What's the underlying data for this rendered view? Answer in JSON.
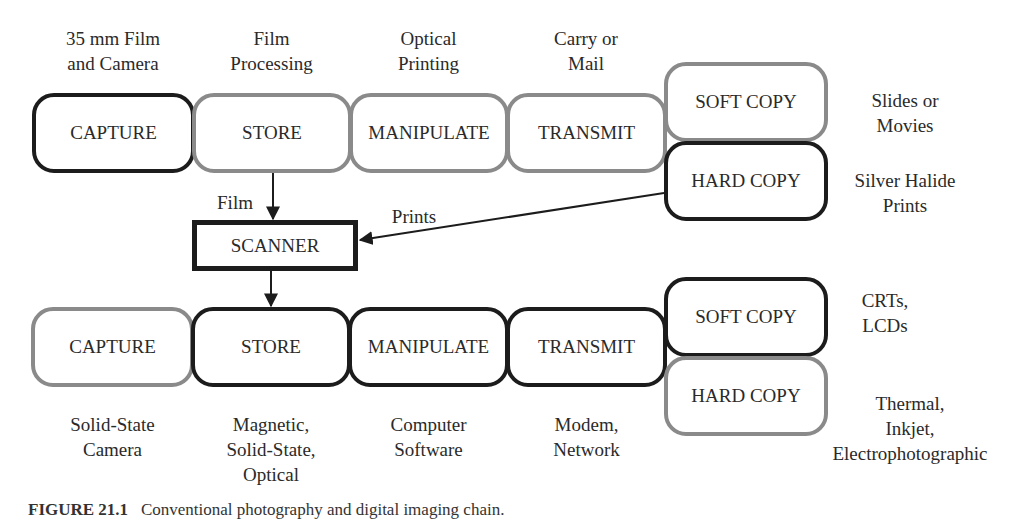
{
  "top_chain": {
    "captions": [
      "35 mm Film\nand Camera",
      "Film\nProcessing",
      "Optical\nPrinting",
      "Carry or\nMail"
    ],
    "boxes": [
      "CAPTURE",
      "STORE",
      "MANIPULATE",
      "TRANSMIT"
    ],
    "outputs": {
      "soft_copy": "SOFT COPY",
      "hard_copy": "HARD COPY",
      "soft_copy_note": "Slides or\nMovies",
      "hard_copy_note": "Silver Halide\nPrints"
    }
  },
  "scanner": {
    "label": "SCANNER",
    "film_label": "Film",
    "prints_label": "Prints"
  },
  "bottom_chain": {
    "boxes": [
      "CAPTURE",
      "STORE",
      "MANIPULATE",
      "TRANSMIT"
    ],
    "captions": [
      "Solid-State\nCamera",
      "Magnetic,\nSolid-State,\nOptical",
      "Computer\nSoftware",
      "Modem,\nNetwork"
    ],
    "outputs": {
      "soft_copy": "SOFT COPY",
      "hard_copy": "HARD COPY",
      "soft_copy_note": "CRTs,\nLCDs",
      "hard_copy_note": "Thermal,\nInkjet,\nElectrophotographic"
    }
  },
  "figure_caption": {
    "number": "FIGURE 21.1",
    "text": "Conventional photography and digital imaging chain."
  },
  "colors": {
    "dark_border": "#1c1c1c",
    "gray_border": "#8a8a8a",
    "text": "#2a2a2a"
  }
}
